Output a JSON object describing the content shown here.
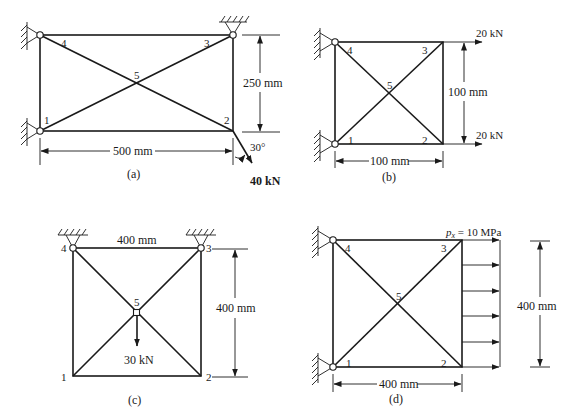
{
  "figures": [
    {
      "id": "a",
      "caption": "(a)",
      "nodes": [
        "1",
        "2",
        "3",
        "4",
        "5"
      ],
      "width_label": "500 mm",
      "height_label": "250 mm",
      "force_label": "40 kN",
      "angle_label": "30°",
      "supports": "pins at nodes 1, 4 (wall) and node 3 (ceiling)"
    },
    {
      "id": "b",
      "caption": "(b)",
      "nodes": [
        "1",
        "2",
        "3",
        "4",
        "5"
      ],
      "width_label": "100 mm",
      "height_label": "100 mm",
      "force_top_label": "20 kN",
      "force_bottom_label": "20 kN",
      "supports": "pins at nodes 1, 4 (wall)"
    },
    {
      "id": "c",
      "caption": "(c)",
      "nodes": [
        "1",
        "2",
        "3",
        "4",
        "5"
      ],
      "width_label": "400 mm",
      "height_label": "400 mm",
      "force_label": "30 kN",
      "supports": "pins at nodes 3, 4 (ceiling)"
    },
    {
      "id": "d",
      "caption": "(d)",
      "nodes": [
        "1",
        "2",
        "3",
        "4",
        "5"
      ],
      "width_label": "400 mm",
      "height_label": "400 mm",
      "pressure_label_var": "p",
      "pressure_label_sub": "x",
      "pressure_label_rest": " = 10 MPa",
      "supports": "pins at nodes 1, 4 (wall)"
    }
  ],
  "colors": {
    "line": "#1a1a1a",
    "background": "#ffffff"
  }
}
